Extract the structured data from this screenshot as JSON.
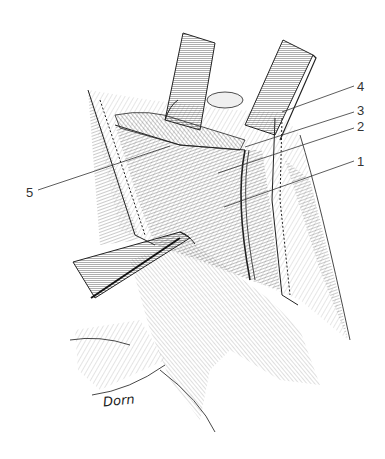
{
  "figure": {
    "type": "surgical-illustration",
    "signature": "Dorn",
    "labels": [
      {
        "id": "1",
        "text": "1",
        "x": 357,
        "y": 155,
        "line": [
          224,
          207,
          354,
          161
        ]
      },
      {
        "id": "2",
        "text": "2",
        "x": 357,
        "y": 120,
        "line": [
          218,
          173,
          354,
          128
        ]
      },
      {
        "id": "3",
        "text": "3",
        "x": 357,
        "y": 104,
        "line": [
          245,
          147,
          354,
          112
        ]
      },
      {
        "id": "4",
        "text": "4",
        "x": 357,
        "y": 80,
        "line": [
          282,
          112,
          354,
          86
        ]
      },
      {
        "id": "5",
        "text": "5",
        "x": 26,
        "y": 186,
        "line": [
          38,
          190,
          170,
          146
        ]
      }
    ],
    "colors": {
      "background": "#ffffff",
      "ink": "#1a1a1a",
      "hatch": "#555555",
      "shade": "#cfcfcf"
    }
  }
}
